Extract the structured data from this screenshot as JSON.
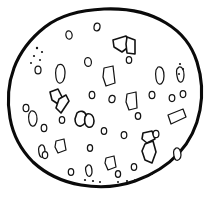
{
  "meta": {
    "title": "Chocolate chip cookie line drawing",
    "subject": "cookie",
    "style": "black-and-white hand-drawn outline illustration",
    "background_color": "#ffffff",
    "ink_color": "#0a0a0a",
    "outline_stroke_width": 3.1,
    "chip_stroke_width": 1.6,
    "canvas": {
      "width": 211,
      "height": 197
    }
  },
  "cookie": {
    "name": "cookie-outline",
    "fill": "#ffffff",
    "stroke": "#0a0a0a",
    "outline_path": "M 104 9 C 128 8 150 13 166 23 C 181 32 192 46 197 62 C 202 78 203 94 200 110 C 197 126 190 141 179 153 C 167 166 152 175 135 181 C 118 187 99 188 81 185 C 63 182 46 174 33 162 C 21 150 13 135 10 118 C 7 101 8 84 14 68 C 20 52 31 38 45 27 C 59 16 81 10 104 9 Z"
  },
  "chips": [
    {
      "name": "chip-vpair-top-right",
      "shape": "v-pair-angular-chunks",
      "paths": [
        "M 113 40 L 126 36 L 131 45 L 122 52 L 114 47 Z",
        "M 127 37 L 135 40 L 135 54 L 127 53 L 126 44 Z"
      ]
    },
    {
      "name": "chip-bent-left-middle",
      "shape": "bent-l-hook",
      "paths": [
        "M 50 92 L 58 89 L 62 97 L 58 104 L 52 100 Z",
        "M 59 99 L 66 95 L 69 101 L 61 113 L 56 108 Z"
      ]
    },
    {
      "name": "chip-pair-center-left",
      "shape": "rounded-chunk-pair",
      "paths": [
        "M 77 113 C 80 110 85 111 86 115 C 87 120 85 125 81 126 C 77 127 75 123 75 119 Z",
        "M 87 114 C 91 113 94 116 94 121 C 94 126 91 128 88 127 C 85 126 84 121 85 117 Z"
      ]
    },
    {
      "name": "chip-hook-bottom-right",
      "shape": "long-bent-hook",
      "paths": [
        "M 143 133 L 152 131 L 155 139 L 147 143 L 142 139 Z",
        "M 145 144 L 153 141 L 156 152 L 152 163 L 145 160 L 142 151 Z"
      ]
    },
    {
      "name": "chip-rect-upper-center",
      "shape": "parallelogram",
      "paths": [
        "M 104 68 L 113 66 L 115 83 L 106 86 L 103 77 Z"
      ]
    },
    {
      "name": "chip-rect-center-right",
      "shape": "parallelogram",
      "paths": [
        "M 127 94 L 136 92 L 137 108 L 129 110 L 126 102 Z"
      ]
    },
    {
      "name": "chip-rect-left-upper",
      "shape": "rounded-oblong",
      "paths": [
        "M 58 65 C 62 63 65 66 65 73 C 65 80 62 84 59 83 C 56 82 55 74 56 69 Z"
      ]
    },
    {
      "name": "chip-rect-far-left",
      "shape": "rounded-oblong",
      "paths": [
        "M 31 111 C 35 110 37 114 37 119 C 37 124 34 127 32 126 C 29 125 28 118 29 114 Z"
      ]
    },
    {
      "name": "chip-rect-lower-left",
      "shape": "parallelogram",
      "paths": [
        "M 56 141 L 64 139 L 66 150 L 58 153 L 55 147 Z"
      ]
    },
    {
      "name": "chip-rect-bottom-center",
      "shape": "parallelogram",
      "paths": [
        "M 106 158 L 114 156 L 116 167 L 108 170 L 105 163 Z"
      ]
    },
    {
      "name": "chip-rect-right-side",
      "shape": "tilted-rectangle",
      "paths": [
        "M 168 115 L 183 109 L 186 117 L 171 124 Z"
      ]
    },
    {
      "name": "chip-rect-right-upper",
      "shape": "rounded-oblong",
      "paths": [
        "M 158 67 C 162 66 164 70 164 76 C 164 82 161 85 159 84 C 156 83 155 75 156 70 Z"
      ]
    },
    {
      "name": "chip-rect-far-right-edge",
      "shape": "rounded-oblong",
      "paths": [
        "M 179 67 C 182 66 184 70 184 75 C 184 80 182 83 180 82 C 177 81 176 71 177 69 Z"
      ]
    },
    {
      "name": "chip-rect-left-mid-oblong",
      "shape": "rounded-oblong",
      "paths": [
        "M 41 145 C 44 144 45 148 45 152 C 45 156 43 158 41 157 C 39 156 38 149 39 147 Z"
      ]
    },
    {
      "name": "chip-rect-right-low",
      "shape": "rounded-oblong",
      "paths": [
        "M 176 148 C 179 147 181 151 181 155 C 181 159 178 161 176 160 C 174 159 173 152 174 150 Z"
      ]
    },
    {
      "name": "chip-rect-bottom-left-small",
      "shape": "rounded-oblong",
      "paths": [
        "M 88 165 C 91 164 92 168 92 172 C 92 175 90 177 88 176 C 86 175 85 168 86 167 Z"
      ]
    }
  ],
  "specks": [
    {
      "name": "speck-oval",
      "cx": 69,
      "cy": 35,
      "rx": 3.1,
      "ry": 4.2,
      "rot": -10
    },
    {
      "name": "speck-oval",
      "cx": 97,
      "cy": 27,
      "rx": 3.0,
      "ry": 3.8,
      "rot": 8
    },
    {
      "name": "speck-oval",
      "cx": 88,
      "cy": 62,
      "rx": 3.4,
      "ry": 4.4,
      "rot": -6
    },
    {
      "name": "speck-oval",
      "cx": 92,
      "cy": 95,
      "rx": 2.8,
      "ry": 3.6,
      "rot": 0
    },
    {
      "name": "speck-oval",
      "cx": 112,
      "cy": 99,
      "rx": 3.0,
      "ry": 3.7,
      "rot": 12
    },
    {
      "name": "speck-oval",
      "cx": 38,
      "cy": 70,
      "rx": 3.0,
      "ry": 3.9,
      "rot": 0
    },
    {
      "name": "speck-oval",
      "cx": 26,
      "cy": 108,
      "rx": 2.9,
      "ry": 3.7,
      "rot": 0
    },
    {
      "name": "speck-oval",
      "cx": 44,
      "cy": 128,
      "rx": 2.8,
      "ry": 3.6,
      "rot": 0
    },
    {
      "name": "speck-oval",
      "cx": 45,
      "cy": 155,
      "rx": 2.7,
      "ry": 3.5,
      "rot": 0
    },
    {
      "name": "speck-oval",
      "cx": 71,
      "cy": 172,
      "rx": 2.7,
      "ry": 3.4,
      "rot": 0
    },
    {
      "name": "speck-oval",
      "cx": 104,
      "cy": 131,
      "rx": 2.7,
      "ry": 3.4,
      "rot": 0
    },
    {
      "name": "speck-oval",
      "cx": 124,
      "cy": 135,
      "rx": 2.8,
      "ry": 3.5,
      "rot": 0
    },
    {
      "name": "speck-oval",
      "cx": 138,
      "cy": 116,
      "rx": 2.7,
      "ry": 3.3,
      "rot": 0
    },
    {
      "name": "speck-oval",
      "cx": 152,
      "cy": 95,
      "rx": 2.9,
      "ry": 3.6,
      "rot": 0
    },
    {
      "name": "speck-oval",
      "cx": 156,
      "cy": 134,
      "rx": 2.9,
      "ry": 3.7,
      "rot": 0
    },
    {
      "name": "speck-oval",
      "cx": 172,
      "cy": 98,
      "rx": 2.8,
      "ry": 3.5,
      "rot": 0
    },
    {
      "name": "speck-oval",
      "cx": 183,
      "cy": 94,
      "rx": 2.8,
      "ry": 3.5,
      "rot": 0
    },
    {
      "name": "speck-oval",
      "cx": 134,
      "cy": 167,
      "rx": 2.7,
      "ry": 3.4,
      "rot": 0
    },
    {
      "name": "speck-oval",
      "cx": 118,
      "cy": 174,
      "rx": 2.6,
      "ry": 3.3,
      "rot": 0
    },
    {
      "name": "speck-oval",
      "cx": 90,
      "cy": 148,
      "rx": 2.6,
      "ry": 3.3,
      "rot": 0
    },
    {
      "name": "speck-oval",
      "cx": 62,
      "cy": 120,
      "rx": 2.7,
      "ry": 3.4,
      "rot": 0
    },
    {
      "name": "speck-oval",
      "cx": 129,
      "cy": 60,
      "rx": 2.7,
      "ry": 3.4,
      "rot": 0
    }
  ],
  "dots": [
    {
      "name": "dot",
      "cx": 37,
      "cy": 48,
      "r": 1.2
    },
    {
      "name": "dot",
      "cx": 42,
      "cy": 52,
      "r": 1.1
    },
    {
      "name": "dot",
      "cx": 34,
      "cy": 56,
      "r": 1.1
    },
    {
      "name": "dot",
      "cx": 40,
      "cy": 60,
      "r": 1.0
    },
    {
      "name": "dot",
      "cx": 31,
      "cy": 63,
      "r": 1.0
    },
    {
      "name": "dot",
      "cx": 180,
      "cy": 64,
      "r": 1.1
    },
    {
      "name": "dot",
      "cx": 183,
      "cy": 69,
      "r": 1.1
    },
    {
      "name": "dot",
      "cx": 179,
      "cy": 74,
      "r": 1.0
    },
    {
      "name": "dot",
      "cx": 85,
      "cy": 180,
      "r": 1.1
    },
    {
      "name": "dot",
      "cx": 93,
      "cy": 181,
      "r": 1.1
    },
    {
      "name": "dot",
      "cx": 100,
      "cy": 182,
      "r": 1.0
    },
    {
      "name": "dot",
      "cx": 118,
      "cy": 182,
      "r": 1.0
    },
    {
      "name": "dot",
      "cx": 127,
      "cy": 181,
      "r": 1.1
    },
    {
      "name": "dot",
      "cx": 135,
      "cy": 180,
      "r": 1.0
    },
    {
      "name": "dot",
      "cx": 145,
      "cy": 177,
      "r": 1.0
    },
    {
      "name": "dot",
      "cx": 152,
      "cy": 174,
      "r": 1.0
    }
  ]
}
